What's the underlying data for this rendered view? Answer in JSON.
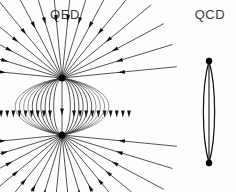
{
  "figure": {
    "background_color": "#fdfdfd",
    "line_color": "#1b1b1b",
    "charge_color": "#000000",
    "label_color": "#3b3b3b",
    "panels": [
      {
        "id": "qed",
        "label": "QED"
      },
      {
        "id": "qcd",
        "label": "QCD"
      }
    ]
  },
  "chart_data": {
    "type": "diagram",
    "title": "",
    "subtitle": "",
    "panels": [
      {
        "name": "QED",
        "label": "QED",
        "field_type": "electric dipole",
        "charges": [
          {
            "id": "upper-charge",
            "x": 62,
            "y": 78,
            "radius": 3.6,
            "sign": "source"
          },
          {
            "id": "lower-charge",
            "x": 62,
            "y": 135,
            "radius": 3.6,
            "sign": "sink"
          }
        ],
        "radial_line_count": 16,
        "dipole_loop_count": 10,
        "arrow_direction": "inward toward charges",
        "extent": {
          "x_min": 0,
          "x_max": 128,
          "y_min": 27,
          "y_max": 192
        }
      },
      {
        "name": "QCD",
        "label": "QCD",
        "field_type": "colour flux tube",
        "quarks": [
          {
            "id": "upper-quark",
            "x": 209,
            "y": 61,
            "radius": 3.2
          },
          {
            "id": "lower-quark",
            "x": 209,
            "y": 163,
            "radius": 3.2
          }
        ],
        "tube": {
          "center_x": 209,
          "top_y": 61,
          "bottom_y": 163,
          "half_width": 7.5,
          "axis_line": true
        },
        "extent": {
          "x_min": 200,
          "x_max": 219,
          "y_min": 58,
          "y_max": 166
        }
      }
    ],
    "legend": [],
    "grid": false
  }
}
